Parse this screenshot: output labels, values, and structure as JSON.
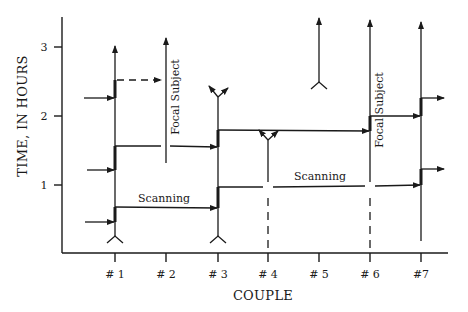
{
  "diagram": {
    "y_axis": {
      "title": "TIME, IN HOURS",
      "ticks": [
        {
          "label": "1",
          "value": 1
        },
        {
          "label": "2",
          "value": 2
        },
        {
          "label": "3",
          "value": 3
        }
      ]
    },
    "x_axis": {
      "title": "COUPLE",
      "ticks": [
        {
          "label": "# 1"
        },
        {
          "label": "# 2"
        },
        {
          "label": "# 3"
        },
        {
          "label": "# 4"
        },
        {
          "label": "# 5"
        },
        {
          "label": "# 6"
        },
        {
          "label": "#7"
        }
      ]
    },
    "annotations": {
      "scanning_1": "Scanning",
      "scanning_2": "Scanning",
      "focal_subject_1": "Focal Subject",
      "focal_subject_2": "Focal Subject"
    },
    "colors": {
      "ink": "#1a1a1a",
      "background": "#ffffff"
    }
  }
}
